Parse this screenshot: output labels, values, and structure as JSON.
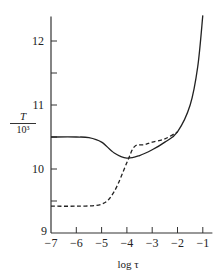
{
  "chart_data": {
    "type": "line",
    "title": "",
    "xlabel": "log τ",
    "ylabel": {
      "numerator": "T",
      "denominator": "10³"
    },
    "xlim": [
      -7,
      -0.7
    ],
    "ylim": [
      9,
      12.4
    ],
    "xticks": [
      -7,
      -6,
      -5,
      -4,
      -3,
      -2,
      -1
    ],
    "xtick_labels": [
      "−7",
      "−6",
      "−5",
      "−4",
      "−3",
      "−2",
      "−1"
    ],
    "yticks": [
      9,
      9.5,
      10,
      10.5,
      11,
      11.5,
      12
    ],
    "ytick_labels": [
      "9",
      "",
      "10",
      "",
      "11",
      "",
      "12"
    ],
    "grid": false,
    "legend": null,
    "series": [
      {
        "name": "solid",
        "style": "solid",
        "x": [
          -7,
          -6,
          -5.5,
          -5,
          -4.5,
          -4,
          -3.5,
          -3,
          -2.5,
          -2,
          -1.5,
          -1.2,
          -1
        ],
        "y": [
          10.5,
          10.5,
          10.49,
          10.42,
          10.25,
          10.17,
          10.21,
          10.3,
          10.42,
          10.58,
          11.0,
          11.6,
          12.4
        ]
      },
      {
        "name": "dashed",
        "style": "dashed",
        "x": [
          -7,
          -6,
          -5,
          -4.5,
          -4,
          -3.7,
          -3.3,
          -3,
          -2.5,
          -2
        ],
        "y": [
          9.42,
          9.42,
          9.45,
          9.65,
          10.1,
          10.35,
          10.38,
          10.42,
          10.47,
          10.58
        ]
      }
    ]
  },
  "labels": {
    "xlabel": "log τ",
    "ylabel_num": "T",
    "ylabel_den": "10³"
  }
}
